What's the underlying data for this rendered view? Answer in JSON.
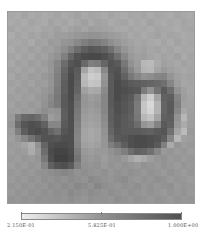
{
  "chart_data": {
    "type": "heatmap",
    "title": "",
    "xlabel": "",
    "ylabel": "",
    "grid": false,
    "rows": 28,
    "cols": 28,
    "colormap": "gray_reversed",
    "vmin": 0.215,
    "vmax": 1.0,
    "colorbar": {
      "position": "bottom",
      "tick_labels": [
        "2.150E-01",
        "5.825E-01",
        "1.000E+00"
      ],
      "tick_values": [
        0.215,
        0.5825,
        1.0
      ]
    },
    "values": [
      [
        0.38,
        0.36,
        0.4,
        0.37,
        0.39,
        0.36,
        0.38,
        0.4,
        0.37,
        0.39,
        0.41,
        0.38,
        0.4,
        0.39,
        0.37,
        0.4,
        0.38,
        0.36,
        0.39,
        0.38,
        0.4,
        0.37,
        0.39,
        0.38,
        0.36,
        0.4,
        0.38,
        0.37
      ],
      [
        0.37,
        0.39,
        0.36,
        0.4,
        0.38,
        0.37,
        0.41,
        0.38,
        0.4,
        0.37,
        0.39,
        0.42,
        0.38,
        0.41,
        0.4,
        0.37,
        0.39,
        0.4,
        0.36,
        0.39,
        0.37,
        0.41,
        0.38,
        0.36,
        0.39,
        0.37,
        0.4,
        0.38
      ],
      [
        0.4,
        0.37,
        0.39,
        0.38,
        0.36,
        0.4,
        0.39,
        0.42,
        0.38,
        0.41,
        0.43,
        0.4,
        0.44,
        0.42,
        0.41,
        0.4,
        0.38,
        0.37,
        0.4,
        0.38,
        0.39,
        0.37,
        0.4,
        0.39,
        0.38,
        0.36,
        0.39,
        0.4
      ],
      [
        0.36,
        0.4,
        0.38,
        0.41,
        0.39,
        0.42,
        0.4,
        0.44,
        0.43,
        0.45,
        0.47,
        0.48,
        0.5,
        0.49,
        0.47,
        0.45,
        0.43,
        0.41,
        0.38,
        0.4,
        0.37,
        0.39,
        0.41,
        0.38,
        0.4,
        0.39,
        0.37,
        0.38
      ],
      [
        0.39,
        0.38,
        0.4,
        0.37,
        0.42,
        0.4,
        0.45,
        0.43,
        0.48,
        0.5,
        0.55,
        0.6,
        0.64,
        0.62,
        0.58,
        0.52,
        0.47,
        0.43,
        0.41,
        0.39,
        0.4,
        0.38,
        0.36,
        0.4,
        0.37,
        0.41,
        0.38,
        0.39
      ],
      [
        0.37,
        0.41,
        0.39,
        0.42,
        0.4,
        0.44,
        0.42,
        0.47,
        0.52,
        0.6,
        0.7,
        0.78,
        0.82,
        0.8,
        0.76,
        0.68,
        0.57,
        0.48,
        0.43,
        0.4,
        0.42,
        0.39,
        0.41,
        0.38,
        0.4,
        0.37,
        0.39,
        0.38
      ],
      [
        0.4,
        0.38,
        0.41,
        0.39,
        0.43,
        0.41,
        0.46,
        0.5,
        0.6,
        0.74,
        0.84,
        0.88,
        0.9,
        0.89,
        0.86,
        0.8,
        0.68,
        0.55,
        0.46,
        0.42,
        0.44,
        0.4,
        0.38,
        0.41,
        0.39,
        0.42,
        0.37,
        0.4
      ],
      [
        0.38,
        0.42,
        0.4,
        0.43,
        0.41,
        0.45,
        0.48,
        0.56,
        0.7,
        0.82,
        0.86,
        0.72,
        0.6,
        0.62,
        0.74,
        0.84,
        0.8,
        0.64,
        0.5,
        0.44,
        0.3,
        0.28,
        0.36,
        0.42,
        0.4,
        0.38,
        0.41,
        0.39
      ],
      [
        0.41,
        0.39,
        0.42,
        0.4,
        0.44,
        0.42,
        0.47,
        0.58,
        0.74,
        0.86,
        0.8,
        0.4,
        0.24,
        0.28,
        0.55,
        0.82,
        0.84,
        0.7,
        0.56,
        0.46,
        0.32,
        0.3,
        0.4,
        0.46,
        0.42,
        0.4,
        0.38,
        0.4
      ],
      [
        0.39,
        0.43,
        0.41,
        0.44,
        0.42,
        0.46,
        0.49,
        0.6,
        0.76,
        0.88,
        0.78,
        0.28,
        0.18,
        0.2,
        0.48,
        0.8,
        0.86,
        0.76,
        0.64,
        0.56,
        0.5,
        0.52,
        0.56,
        0.58,
        0.48,
        0.42,
        0.4,
        0.41
      ],
      [
        0.42,
        0.4,
        0.43,
        0.41,
        0.45,
        0.43,
        0.48,
        0.6,
        0.78,
        0.88,
        0.76,
        0.3,
        0.22,
        0.24,
        0.5,
        0.8,
        0.88,
        0.84,
        0.8,
        0.78,
        0.76,
        0.74,
        0.72,
        0.68,
        0.56,
        0.44,
        0.39,
        0.4
      ],
      [
        0.4,
        0.44,
        0.42,
        0.45,
        0.43,
        0.47,
        0.5,
        0.62,
        0.78,
        0.88,
        0.74,
        0.42,
        0.36,
        0.38,
        0.54,
        0.8,
        0.88,
        0.86,
        0.84,
        0.82,
        0.62,
        0.5,
        0.66,
        0.8,
        0.7,
        0.5,
        0.42,
        0.39
      ],
      [
        0.43,
        0.41,
        0.44,
        0.42,
        0.46,
        0.48,
        0.54,
        0.64,
        0.8,
        0.88,
        0.7,
        0.48,
        0.44,
        0.46,
        0.56,
        0.8,
        0.88,
        0.84,
        0.8,
        0.66,
        0.3,
        0.18,
        0.4,
        0.76,
        0.78,
        0.58,
        0.44,
        0.4
      ],
      [
        0.41,
        0.45,
        0.43,
        0.46,
        0.44,
        0.5,
        0.56,
        0.62,
        0.8,
        0.86,
        0.66,
        0.48,
        0.46,
        0.48,
        0.56,
        0.8,
        0.86,
        0.82,
        0.78,
        0.62,
        0.22,
        0.12,
        0.32,
        0.74,
        0.8,
        0.6,
        0.42,
        0.41
      ],
      [
        0.44,
        0.42,
        0.45,
        0.43,
        0.47,
        0.52,
        0.48,
        0.5,
        0.78,
        0.86,
        0.64,
        0.46,
        0.44,
        0.46,
        0.56,
        0.78,
        0.86,
        0.82,
        0.78,
        0.62,
        0.22,
        0.14,
        0.32,
        0.74,
        0.8,
        0.56,
        0.38,
        0.42
      ],
      [
        0.46,
        0.62,
        0.72,
        0.74,
        0.7,
        0.6,
        0.44,
        0.48,
        0.78,
        0.86,
        0.62,
        0.44,
        0.42,
        0.44,
        0.54,
        0.78,
        0.84,
        0.8,
        0.76,
        0.64,
        0.3,
        0.24,
        0.4,
        0.76,
        0.78,
        0.5,
        0.3,
        0.43
      ],
      [
        0.48,
        0.7,
        0.82,
        0.86,
        0.84,
        0.76,
        0.56,
        0.56,
        0.8,
        0.86,
        0.6,
        0.42,
        0.4,
        0.42,
        0.52,
        0.76,
        0.84,
        0.8,
        0.78,
        0.7,
        0.48,
        0.44,
        0.58,
        0.8,
        0.76,
        0.46,
        0.36,
        0.44
      ],
      [
        0.45,
        0.6,
        0.78,
        0.86,
        0.88,
        0.84,
        0.74,
        0.68,
        0.82,
        0.86,
        0.58,
        0.4,
        0.38,
        0.4,
        0.5,
        0.74,
        0.82,
        0.8,
        0.8,
        0.8,
        0.78,
        0.76,
        0.8,
        0.82,
        0.68,
        0.4,
        0.28,
        0.46
      ],
      [
        0.43,
        0.48,
        0.56,
        0.66,
        0.76,
        0.84,
        0.84,
        0.82,
        0.86,
        0.86,
        0.56,
        0.4,
        0.38,
        0.4,
        0.48,
        0.7,
        0.8,
        0.82,
        0.86,
        0.88,
        0.88,
        0.86,
        0.84,
        0.78,
        0.56,
        0.3,
        0.42,
        0.44
      ],
      [
        0.45,
        0.44,
        0.4,
        0.34,
        0.5,
        0.74,
        0.86,
        0.88,
        0.88,
        0.86,
        0.58,
        0.42,
        0.4,
        0.42,
        0.48,
        0.6,
        0.68,
        0.78,
        0.86,
        0.88,
        0.88,
        0.86,
        0.8,
        0.6,
        0.36,
        0.48,
        0.44,
        0.46
      ],
      [
        0.43,
        0.46,
        0.44,
        0.36,
        0.46,
        0.7,
        0.88,
        0.92,
        0.92,
        0.88,
        0.62,
        0.46,
        0.44,
        0.46,
        0.46,
        0.5,
        0.54,
        0.6,
        0.7,
        0.76,
        0.74,
        0.68,
        0.56,
        0.46,
        0.48,
        0.45,
        0.47,
        0.44
      ],
      [
        0.46,
        0.44,
        0.47,
        0.45,
        0.48,
        0.64,
        0.86,
        0.94,
        0.94,
        0.9,
        0.66,
        0.48,
        0.46,
        0.48,
        0.44,
        0.48,
        0.5,
        0.46,
        0.4,
        0.34,
        0.38,
        0.44,
        0.48,
        0.5,
        0.46,
        0.48,
        0.45,
        0.47
      ],
      [
        0.44,
        0.47,
        0.45,
        0.48,
        0.46,
        0.56,
        0.76,
        0.84,
        0.86,
        0.8,
        0.6,
        0.5,
        0.48,
        0.5,
        0.46,
        0.49,
        0.47,
        0.5,
        0.48,
        0.46,
        0.5,
        0.48,
        0.46,
        0.49,
        0.47,
        0.45,
        0.48,
        0.46
      ],
      [
        0.47,
        0.45,
        0.48,
        0.46,
        0.49,
        0.5,
        0.52,
        0.54,
        0.56,
        0.54,
        0.5,
        0.52,
        0.5,
        0.48,
        0.51,
        0.47,
        0.5,
        0.48,
        0.51,
        0.49,
        0.47,
        0.5,
        0.48,
        0.46,
        0.49,
        0.47,
        0.45,
        0.48
      ],
      [
        0.45,
        0.48,
        0.46,
        0.49,
        0.47,
        0.51,
        0.49,
        0.52,
        0.5,
        0.53,
        0.51,
        0.49,
        0.54,
        0.52,
        0.5,
        0.48,
        0.51,
        0.53,
        0.49,
        0.47,
        0.5,
        0.48,
        0.51,
        0.49,
        0.46,
        0.48,
        0.47,
        0.45
      ],
      [
        0.48,
        0.46,
        0.49,
        0.47,
        0.5,
        0.48,
        0.52,
        0.5,
        0.53,
        0.51,
        0.55,
        0.53,
        0.5,
        0.56,
        0.52,
        0.5,
        0.48,
        0.51,
        0.49,
        0.52,
        0.48,
        0.5,
        0.47,
        0.49,
        0.51,
        0.46,
        0.48,
        0.47
      ],
      [
        0.46,
        0.49,
        0.47,
        0.5,
        0.48,
        0.51,
        0.49,
        0.52,
        0.5,
        0.54,
        0.52,
        0.5,
        0.53,
        0.51,
        0.49,
        0.52,
        0.5,
        0.48,
        0.51,
        0.49,
        0.47,
        0.5,
        0.48,
        0.46,
        0.49,
        0.47,
        0.49,
        0.46
      ],
      [
        0.49,
        0.47,
        0.5,
        0.48,
        0.51,
        0.49,
        0.5,
        0.51,
        0.49,
        0.52,
        0.5,
        0.48,
        0.51,
        0.49,
        0.5,
        0.48,
        0.52,
        0.5,
        0.48,
        0.51,
        0.49,
        0.47,
        0.5,
        0.48,
        0.46,
        0.49,
        0.47,
        0.48
      ]
    ]
  }
}
